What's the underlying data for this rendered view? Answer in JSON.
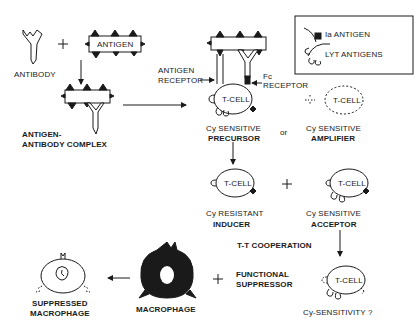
{
  "diagram": {
    "top_left": {
      "antibody_label": "ANTIBODY",
      "plus": "+",
      "antigen_label": "ANTIGEN",
      "complex_label_1": "ANTIGEN-",
      "complex_label_2": "ANTIBODY COMPLEX"
    },
    "legend": {
      "ia_antigen": "Ia ANTIGEN",
      "lyt_antigens": "LYT ANTIGENS"
    },
    "receptors": {
      "antigen_receptor_1": "ANTIGEN",
      "antigen_receptor_2": "RECEPTOR",
      "fc_receptor_1": "Fc",
      "fc_receptor_2": "RECEPTOR"
    },
    "cells": {
      "tcell_label": "T-CELL",
      "precursor_line1": "Cy SENSITIVE",
      "precursor_line2": "PRECURSOR",
      "or": "or",
      "amplifier_line1": "Cy SENSITIVE",
      "amplifier_line2": "AMPLIFIER",
      "inducer_line1": "Cy RESISTANT",
      "inducer_line2": "INDUCER",
      "plus": "+",
      "acceptor_line1": "Cy SENSITIVE",
      "acceptor_line2": "ACCEPTOR",
      "cooperation": "T-T COOPERATION",
      "functional_1": "FUNCTIONAL",
      "functional_2": "SUPPRESSOR",
      "sensitivity": "Cy-SENSITIVITY ?"
    },
    "bottom": {
      "suppressed_1": "SUPPRESSED",
      "suppressed_2": "MACROPHAGE",
      "macrophage": "MACROPHAGE",
      "plus": "+"
    }
  }
}
